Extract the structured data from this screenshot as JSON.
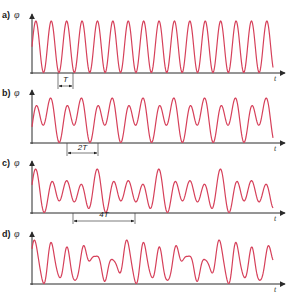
{
  "figure": {
    "colors": {
      "wave": "#d6405a",
      "axis": "#2a2a2a",
      "text": "#1a1a1a"
    },
    "axis_x_start": 32,
    "axis_x_end": 285,
    "wave_x_end": 273,
    "panels": [
      {
        "id": "a",
        "label": "a)",
        "y_symbol": "φ",
        "x_symbol": "t",
        "top": 12,
        "baseline": 73,
        "period_px": 15.4,
        "harmonics": [
          [
            1,
            1.0,
            0
          ]
        ],
        "marker": {
          "label": "T",
          "x1": 58,
          "x2": 73,
          "arrow_y": 86,
          "label_y": 82
        }
      },
      {
        "id": "b",
        "label": "b)",
        "y_symbol": "φ",
        "x_symbol": "t",
        "top": 89,
        "baseline": 143,
        "period_px": 30.8,
        "harmonics": [
          [
            1,
            0.6,
            -1.2
          ],
          [
            2,
            1.0,
            0
          ]
        ],
        "marker": {
          "label": "2T",
          "x1": 67,
          "x2": 98,
          "arrow_y": 153,
          "label_y": 150
        }
      },
      {
        "id": "c",
        "label": "c)",
        "y_symbol": "φ",
        "x_symbol": "t",
        "top": 160,
        "baseline": 213,
        "period_px": 61.6,
        "harmonics": [
          [
            4,
            1.0,
            0
          ],
          [
            3,
            0.45,
            0.6
          ],
          [
            2,
            0.35,
            1.1
          ]
        ],
        "marker": {
          "label": "4T",
          "x1": 73,
          "x2": 135,
          "arrow_y": 221,
          "label_y": 217
        }
      },
      {
        "id": "d",
        "label": "d)",
        "y_symbol": "φ",
        "x_symbol": "t",
        "top": 231,
        "baseline": 284,
        "period_px": 92.4,
        "harmonics": [
          [
            6,
            1.0,
            0
          ],
          [
            5,
            0.5,
            1.3
          ],
          [
            3,
            0.45,
            2.2
          ],
          [
            11,
            0.18,
            0.7
          ],
          [
            2,
            0.3,
            0.4
          ]
        ],
        "marker": null
      }
    ]
  }
}
